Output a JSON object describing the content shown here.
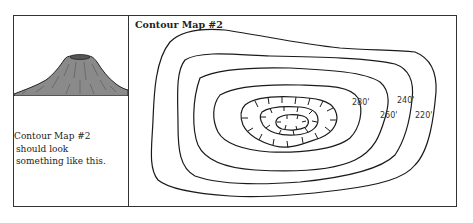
{
  "figure": {
    "left_panel": {
      "image": "volcano-illustration",
      "caption": {
        "line1": "Contour Map #2",
        "line2": "should look",
        "line3": "something like this."
      }
    },
    "map_panel": {
      "title": "Contour Map #2",
      "contour_labels": [
        {
          "text": "280'",
          "x": 338,
          "y": 103
        },
        {
          "text": "240'",
          "x": 378,
          "y": 100
        },
        {
          "text": "260'",
          "x": 381,
          "y": 117
        },
        {
          "text": "220'",
          "x": 415,
          "y": 117
        }
      ]
    },
    "colors": {
      "line": "#1a1a1a",
      "volcano_fill": "#8a8a8a",
      "frame": "#333333"
    }
  }
}
